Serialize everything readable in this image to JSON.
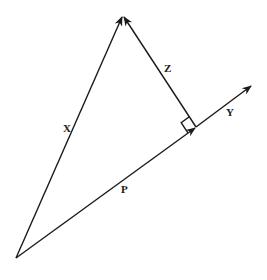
{
  "diagram": {
    "type": "vector-projection",
    "points": {
      "origin": [
        16,
        258
      ],
      "apex": [
        123,
        15
      ],
      "foot": [
        196,
        127
      ],
      "y_tip": [
        252,
        85
      ]
    },
    "vectors": [
      {
        "id": "X",
        "label": "X",
        "from": "origin",
        "to": "apex",
        "label_pos": [
          67,
          129
        ]
      },
      {
        "id": "Z",
        "label": "Z",
        "from": "foot",
        "to": "apex",
        "label_pos": [
          168,
          70
        ]
      },
      {
        "id": "P",
        "label": "P",
        "from": "origin",
        "to": "foot",
        "label_pos": [
          125,
          192
        ]
      },
      {
        "id": "Y",
        "label": "Y",
        "from": "foot",
        "to": "y_tip",
        "label_pos": [
          229,
          114
        ]
      }
    ],
    "right_angle_at": "foot",
    "colors": {
      "stroke": "#1a1a1a",
      "background": "#ffffff"
    }
  },
  "labels": {
    "x": "X",
    "y": "Y",
    "z": "Z",
    "p": "P"
  }
}
